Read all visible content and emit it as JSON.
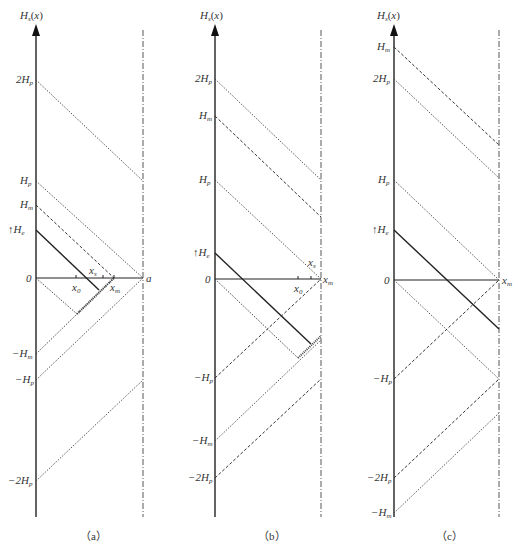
{
  "figure": {
    "panels": [
      {
        "id": "a",
        "caption": "(a)",
        "axis_title": "Hs(x)",
        "y_labels": [
          "2Hp",
          "Hp",
          "Hm",
          "↑He",
          "0",
          "−Hm",
          "−Hp",
          "−2Hp"
        ],
        "x_labels": [
          "x0",
          "xs",
          "xm",
          "a"
        ]
      },
      {
        "id": "b",
        "caption": "(b)",
        "axis_title": "Hs(x)",
        "y_labels": [
          "2Hp",
          "Hm",
          "Hp",
          "↑He",
          "0",
          "−Hp",
          "−Hm",
          "−2Hp"
        ],
        "x_labels": [
          "x0",
          "xs",
          "xm"
        ]
      },
      {
        "id": "c",
        "caption": "(c)",
        "axis_title": "Hs(x)",
        "y_labels": [
          "Hm",
          "2Hp",
          "Hp",
          "↑He",
          "0",
          "−Hp",
          "−2Hp",
          "−Hm"
        ],
        "x_labels": [
          "xm"
        ]
      }
    ],
    "line_styles": {
      "solid": "#222222",
      "dashed": "#333333",
      "dotted": "#444444",
      "dash_dot_boundary": "#444444"
    }
  }
}
